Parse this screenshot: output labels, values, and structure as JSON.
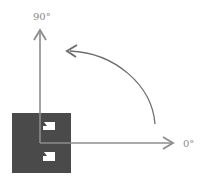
{
  "diagram": {
    "labels": {
      "vertical_axis": "90°",
      "horizontal_axis": "0°"
    },
    "colors": {
      "axis": "#8c8c8c",
      "block": "#4a4a4a",
      "notch": "#ffffff",
      "label": "#8a8a8a"
    },
    "elements": {
      "rotation_arc": "counter-clockwise rotation from 0° to 90°",
      "block": "dark square component with two white notches"
    }
  }
}
